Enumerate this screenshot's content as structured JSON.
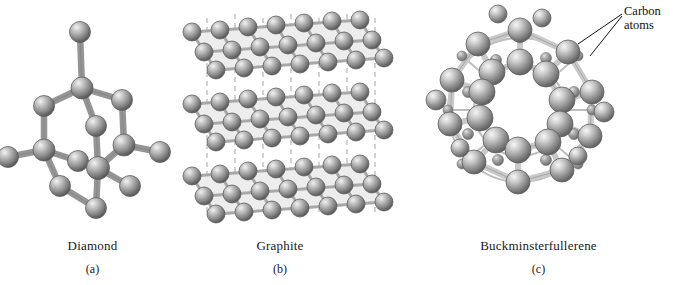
{
  "figure": {
    "background": "#ffffff",
    "panels": [
      {
        "key": "a",
        "name": "Diamond",
        "letter": "(a)",
        "structure": "tetrahedral-covalent-network",
        "atom_count_visible": 14
      },
      {
        "key": "b",
        "name": "Graphite",
        "letter": "(b)",
        "structure": "stacked-hexagonal-layers",
        "layer_count": 3
      },
      {
        "key": "c",
        "name": "Buckminsterfullerene",
        "letter": "(c)",
        "structure": "truncated-icosahedron-cage",
        "atom_count_visible": 60
      }
    ]
  },
  "annotations": [
    {
      "id": "carbon-atoms",
      "line1": "Carbon",
      "line2": "atoms",
      "target_panel": "c",
      "leader_lines": 2
    }
  ],
  "colors": {
    "sphere_mid": "#8b8b8b",
    "sphere_dark": "#5c5c5c",
    "sphere_light": "#e8e8e8",
    "bond_fill": "#d8d8d8",
    "bond_stroke": "#707070",
    "sheet_fill": "#ededed",
    "dashed_line": "#b4b4b4",
    "text": "#1a1a1a",
    "leader_line": "#111111",
    "background": "#ffffff"
  }
}
